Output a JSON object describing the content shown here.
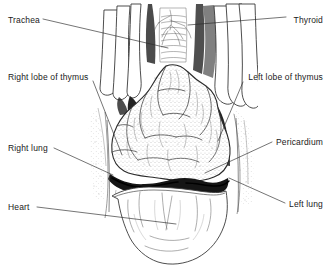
{
  "figure": {
    "style": "black and white anatomical line drawing with stipple shading",
    "background_color": "#ffffff",
    "ink_color": "#1a1a1a",
    "width": 331,
    "height": 274
  },
  "labels": [
    {
      "id": "trachea",
      "text": "Trachea",
      "side": "left",
      "x": 8,
      "y": 15,
      "leader_from": [
        43,
        19
      ],
      "leader_to": [
        168,
        48
      ]
    },
    {
      "id": "thyroid",
      "text": "Thyroid",
      "side": "right",
      "x": 323,
      "y": 15,
      "leader_from": [
        286,
        17
      ],
      "leader_to": [
        188,
        25
      ]
    },
    {
      "id": "right-lobe-of-thymus",
      "text": "Right lobe of thymus",
      "side": "left",
      "x": 8,
      "y": 72,
      "leader_from": [
        93,
        81
      ],
      "leader_to": [
        122,
        155
      ]
    },
    {
      "id": "left-lobe-of-thymus",
      "text": "Left lobe of thymus",
      "side": "right",
      "x": 323,
      "y": 72,
      "leader_from": [
        243,
        82
      ],
      "leader_to": [
        218,
        141
      ]
    },
    {
      "id": "right-lung",
      "text": "Right lung",
      "side": "left",
      "x": 8,
      "y": 143,
      "leader_from": [
        54,
        148
      ],
      "leader_to": [
        113,
        175
      ]
    },
    {
      "id": "pericardium",
      "text": "Pericardium",
      "side": "right",
      "x": 323,
      "y": 137,
      "leader_from": [
        272,
        142
      ],
      "leader_to": [
        205,
        173
      ]
    },
    {
      "id": "left-lung",
      "text": "Left lung",
      "side": "right",
      "x": 323,
      "y": 199,
      "leader_from": [
        285,
        203
      ],
      "leader_to": [
        229,
        178
      ]
    },
    {
      "id": "heart",
      "text": "Heart",
      "side": "left",
      "x": 8,
      "y": 202,
      "leader_from": [
        37,
        207
      ],
      "leader_to": [
        176,
        224
      ]
    }
  ],
  "structures": [
    {
      "id": "trachea",
      "name": "Trachea",
      "description": "midline cartilaginous tube in the neck with horizontal rings"
    },
    {
      "id": "thyroid",
      "name": "Thyroid",
      "description": "gland at the base of the neck beside the trachea"
    },
    {
      "id": "right-lobe-of-thymus",
      "name": "Right lobe of thymus",
      "description": "lobulated stippled mass left of midline in the image"
    },
    {
      "id": "left-lobe-of-thymus",
      "name": "Left lobe of thymus",
      "description": "lobulated stippled mass right of midline in the image"
    },
    {
      "id": "right-lung",
      "name": "Right lung",
      "description": "stippled lung margin at the left edge of the thoracic opening"
    },
    {
      "id": "left-lung",
      "name": "Left lung",
      "description": "stippled lung margin at the right edge of the thoracic opening"
    },
    {
      "id": "pericardium",
      "name": "Pericardium",
      "description": "dark reflection band above the heart"
    },
    {
      "id": "heart",
      "name": "Heart",
      "description": "smooth rounded organ filling the lower portion of the field"
    },
    {
      "id": "strap-muscles",
      "name": "Strap muscles",
      "description": "pale vertical bands flanking the trachea in the neck"
    }
  ]
}
